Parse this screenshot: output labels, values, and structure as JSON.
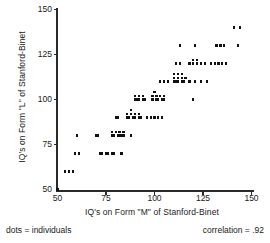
{
  "chart_data": {
    "type": "scatter",
    "title": "",
    "xlabel": "IQ's on Form \"M\" of Stanford-Binet",
    "ylabel": "IQ's on Form \"L\" of Stanford-Binet",
    "xlim": [
      50,
      150
    ],
    "ylim": [
      50,
      150
    ],
    "xticks": [
      50,
      75,
      100,
      125,
      150
    ],
    "yticks": [
      50,
      75,
      100,
      125,
      150
    ],
    "xtick_labels": [
      "50",
      "75",
      "100",
      "125",
      "150"
    ],
    "ytick_labels": [
      "50",
      "75",
      "100",
      "125",
      "150"
    ],
    "grid": false,
    "legend": "none",
    "marker": "dot",
    "marker_label": "dots = individuals",
    "correlation": 0.92,
    "points": [
      [
        50,
        50
      ],
      [
        54,
        60
      ],
      [
        56,
        60
      ],
      [
        58,
        60
      ],
      [
        59,
        70
      ],
      [
        61,
        70
      ],
      [
        60,
        80
      ],
      [
        72,
        70
      ],
      [
        73,
        70
      ],
      [
        75,
        70
      ],
      [
        76,
        70
      ],
      [
        78,
        70
      ],
      [
        79,
        70
      ],
      [
        83,
        70
      ],
      [
        70,
        80
      ],
      [
        71,
        80
      ],
      [
        78,
        80
      ],
      [
        79,
        80
      ],
      [
        81,
        80
      ],
      [
        82,
        80
      ],
      [
        83,
        80
      ],
      [
        84,
        80
      ],
      [
        78,
        82
      ],
      [
        80,
        82
      ],
      [
        82,
        82
      ],
      [
        84,
        82
      ],
      [
        88,
        80
      ],
      [
        80,
        90
      ],
      [
        81,
        90
      ],
      [
        86,
        90
      ],
      [
        87,
        90
      ],
      [
        89,
        90
      ],
      [
        90,
        90
      ],
      [
        92,
        90
      ],
      [
        93,
        90
      ],
      [
        86,
        92
      ],
      [
        88,
        92
      ],
      [
        90,
        92
      ],
      [
        92,
        92
      ],
      [
        88,
        94
      ],
      [
        96,
        90
      ],
      [
        98,
        90
      ],
      [
        100,
        90
      ],
      [
        102,
        90
      ],
      [
        104,
        90
      ],
      [
        90,
        100
      ],
      [
        91,
        100
      ],
      [
        92,
        100
      ],
      [
        94,
        100
      ],
      [
        95,
        100
      ],
      [
        90,
        102
      ],
      [
        92,
        102
      ],
      [
        94,
        102
      ],
      [
        99,
        100
      ],
      [
        101,
        100
      ],
      [
        102,
        100
      ],
      [
        104,
        100
      ],
      [
        105,
        100
      ],
      [
        99,
        102
      ],
      [
        101,
        102
      ],
      [
        103,
        102
      ],
      [
        105,
        102
      ],
      [
        100,
        104
      ],
      [
        120,
        100
      ],
      [
        103,
        110
      ],
      [
        105,
        110
      ],
      [
        107,
        110
      ],
      [
        110,
        110
      ],
      [
        111,
        110
      ],
      [
        112,
        110
      ],
      [
        114,
        110
      ],
      [
        115,
        110
      ],
      [
        110,
        112
      ],
      [
        112,
        112
      ],
      [
        114,
        112
      ],
      [
        116,
        112
      ],
      [
        110,
        114
      ],
      [
        112,
        114
      ],
      [
        114,
        114
      ],
      [
        118,
        110
      ],
      [
        121,
        110
      ],
      [
        124,
        110
      ],
      [
        127,
        110
      ],
      [
        111,
        120
      ],
      [
        113,
        120
      ],
      [
        118,
        120
      ],
      [
        120,
        120
      ],
      [
        122,
        120
      ],
      [
        124,
        120
      ],
      [
        126,
        120
      ],
      [
        120,
        122
      ],
      [
        122,
        122
      ],
      [
        129,
        120
      ],
      [
        131,
        120
      ],
      [
        133,
        120
      ],
      [
        135,
        120
      ],
      [
        137,
        120
      ],
      [
        113,
        130
      ],
      [
        121,
        130
      ],
      [
        132,
        130
      ],
      [
        134,
        130
      ],
      [
        136,
        130
      ],
      [
        143,
        130
      ],
      [
        141,
        140
      ],
      [
        144,
        140
      ]
    ]
  },
  "annotations": {
    "dots_note": "dots = individuals",
    "correlation_note": "correlation = .92"
  },
  "colors": {
    "dot": "#111111",
    "axis": "#2a2a2a",
    "text": "#1a1a1a",
    "background": "#ffffff"
  }
}
